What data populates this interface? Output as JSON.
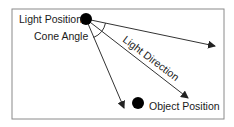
{
  "labels": {
    "light_position": "Light Position",
    "cone_angle": "Cone Angle",
    "light_direction": "Light Direction",
    "object_position": "Object Position"
  },
  "colors": {
    "frame": "#8a8a8a",
    "line": "#333333",
    "dot": "#000000",
    "text": "#1a1a1a"
  }
}
